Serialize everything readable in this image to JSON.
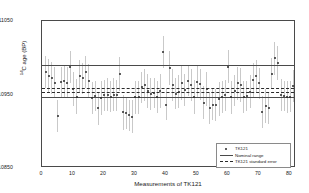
{
  "chart_data": {
    "type": "scatter",
    "title": "",
    "xlabel": "Measurements of TK121",
    "ylabel_html": "<sup>14</sup>C age (BP)",
    "ylabel": "14C age (BP)",
    "xlim": [
      0,
      82
    ],
    "ylim": [
      10850,
      11050
    ],
    "xticks": [
      0,
      10,
      20,
      30,
      40,
      50,
      60,
      70,
      80
    ],
    "yticks": [
      10850,
      10950,
      11050
    ],
    "ytick_labels": [
      "10850",
      "10950",
      "11050"
    ],
    "xtick_labels": [
      "0",
      "10",
      "20",
      "30",
      "40",
      "50",
      "60",
      "70",
      "80"
    ],
    "grid": false,
    "legend_position": "lower right",
    "reference_lines": [
      {
        "name": "nominal-range-upper",
        "value": 10990,
        "style": "solid",
        "color": "#4a4a4a"
      },
      {
        "name": "nominal-range-lower",
        "value": 10947,
        "style": "solid",
        "color": "#4a4a4a"
      },
      {
        "name": "standard-error-upper",
        "value": 10959,
        "style": "dashed",
        "color": "#2a2a2a"
      },
      {
        "name": "standard-error-lower",
        "value": 10954,
        "style": "dashed",
        "color": "#2a2a2a"
      }
    ],
    "series": [
      {
        "name": "TK121",
        "marker": "point",
        "color": "#2a2a2a",
        "errorbar_color": "#c9c9c9",
        "x": [
          1,
          2,
          3,
          4,
          5,
          6,
          7,
          8,
          9,
          10,
          11,
          12,
          13,
          14,
          15,
          16,
          17,
          18,
          19,
          20,
          21,
          22,
          23,
          24,
          25,
          26,
          27,
          28,
          29,
          30,
          31,
          32,
          33,
          34,
          35,
          36,
          37,
          38,
          39,
          40,
          41,
          42,
          43,
          44,
          45,
          46,
          47,
          48,
          49,
          50,
          51,
          52,
          53,
          54,
          55,
          56,
          57,
          58,
          59,
          60,
          61,
          62,
          63,
          64,
          65,
          66,
          67,
          68,
          69,
          70,
          71,
          72,
          73,
          74,
          75,
          76,
          77,
          78,
          79,
          80,
          81
        ],
        "y": [
          10981,
          10975,
          10972,
          10966,
          10921,
          10967,
          10968,
          10966,
          10987,
          10957,
          10947,
          10975,
          10972,
          10981,
          10968,
          10945,
          10948,
          10931,
          10945,
          10949,
          10950,
          10947,
          10950,
          10949,
          10978,
          10926,
          10925,
          10922,
          10920,
          10946,
          10946,
          10960,
          10963,
          10955,
          10951,
          10952,
          10947,
          10955,
          11008,
          10936,
          10986,
          10963,
          10951,
          10954,
          10966,
          10956,
          10969,
          10963,
          10947,
          10967,
          10964,
          10939,
          10958,
          10932,
          10936,
          10936,
          10944,
          10947,
          10949,
          10988,
          10946,
          10955,
          10965,
          10963,
          10947,
          10948,
          10954,
          10970,
          10975,
          10965,
          10926,
          10934,
          10932,
          10978,
          10999,
          10993,
          10949,
          10948,
          10947,
          10947,
          10962
        ],
        "yerr": [
          22,
          23,
          22,
          21,
          22,
          21,
          22,
          21,
          22,
          23,
          24,
          22,
          21,
          22,
          23,
          22,
          21,
          22,
          23,
          21,
          22,
          21,
          22,
          21,
          23,
          24,
          22,
          21,
          22,
          23,
          22,
          21,
          22,
          23,
          22,
          21,
          22,
          23,
          22,
          21,
          23,
          22,
          21,
          22,
          23,
          22,
          21,
          22,
          23,
          22,
          21,
          22,
          23,
          22,
          21,
          22,
          23,
          22,
          21,
          23,
          22,
          21,
          22,
          23,
          22,
          21,
          22,
          23,
          22,
          21,
          22,
          23,
          22,
          21,
          22,
          23,
          22,
          21,
          22,
          21,
          22
        ]
      }
    ],
    "legend_entries": [
      {
        "label": "TK121",
        "key": "marker"
      },
      {
        "label": "Nominal range",
        "key": "solid-line"
      },
      {
        "label": "TK121 standard error",
        "key": "dashed-line"
      }
    ]
  }
}
